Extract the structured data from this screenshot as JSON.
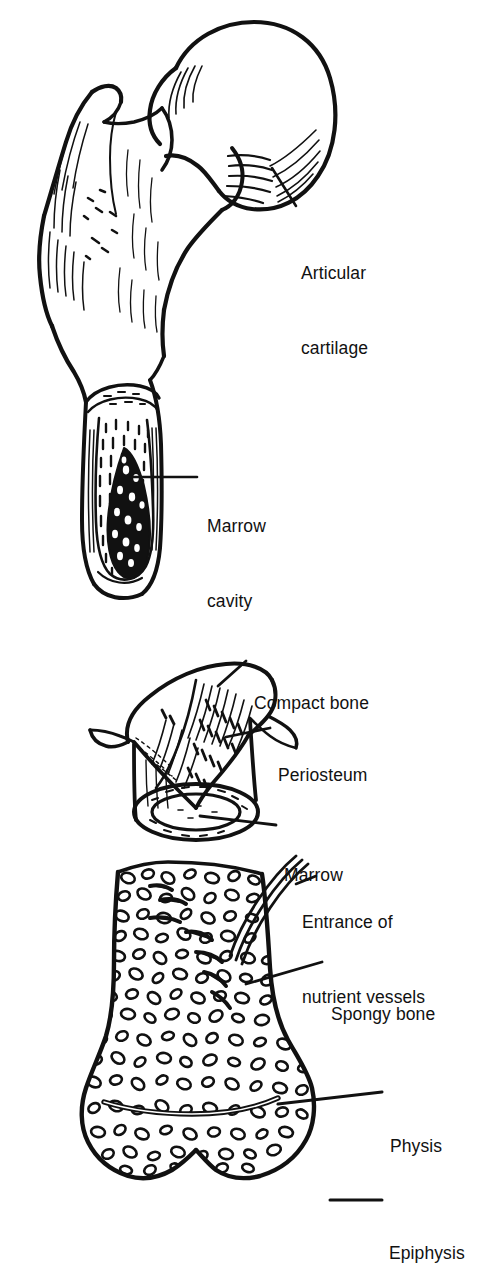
{
  "figure": {
    "style": "black-and-white line drawing",
    "ink_color": "#111111",
    "background_color": "#ffffff"
  },
  "panels": [
    {
      "id": "proximal-femur",
      "name": "Proximal femur with cut-away shaft",
      "labels": [
        "articular_cartilage",
        "marrow_cavity"
      ]
    },
    {
      "id": "bone-cylinder",
      "name": "Bone cylinder with periosteum peeled back",
      "labels": [
        "compact_bone",
        "periosteum",
        "marrow"
      ]
    },
    {
      "id": "distal-femur",
      "name": "Distal femur with spongy bone and growth plate",
      "labels": [
        "entrance_of_nutrient_vessels",
        "spongy_bone",
        "physis",
        "epiphysis"
      ]
    }
  ],
  "labels": {
    "articular_cartilage": {
      "line1": "Articular",
      "line2": "cartilage"
    },
    "marrow_cavity": {
      "line1": "Marrow",
      "line2": "cavity"
    },
    "compact_bone": {
      "line1": "Compact bone"
    },
    "periosteum": {
      "line1": "Periosteum"
    },
    "marrow": {
      "line1": "Marrow"
    },
    "entrance_of_nutrient_vessels": {
      "line1": "Entrance of",
      "line2": "nutrient vessels"
    },
    "spongy_bone": {
      "line1": "Spongy bone"
    },
    "physis": {
      "line1": "Physis"
    },
    "epiphysis": {
      "line1": "Epiphysis"
    }
  }
}
